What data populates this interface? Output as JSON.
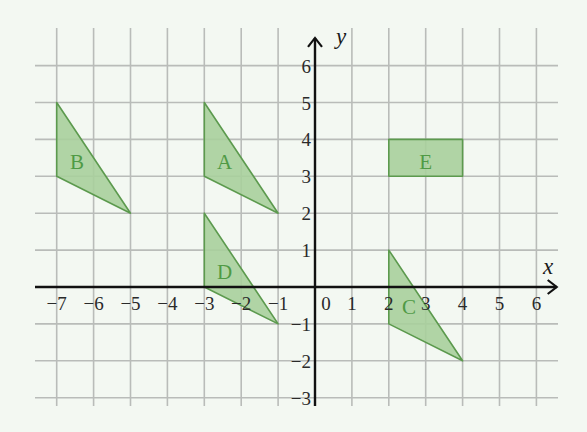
{
  "axes": {
    "x_label": "x",
    "y_label": "y",
    "x_min": -7,
    "x_max": 6,
    "y_min": -3,
    "y_max": 6,
    "x_ticks": [
      "−7",
      "−6",
      "−5",
      "−4",
      "−3",
      "−2",
      "−1",
      "0",
      "1",
      "2",
      "3",
      "4",
      "5",
      "6"
    ],
    "y_ticks": [
      "6",
      "5",
      "4",
      "3",
      "2",
      "1",
      "−1",
      "−2",
      "−3"
    ]
  },
  "colors": {
    "background": "#f3f8f2",
    "grid": "#b9bcb9",
    "axis": "#111111",
    "shape_fill": "#a9cf9c",
    "shape_stroke": "#5c9a4e",
    "label": "#4f9a45"
  },
  "shapes": [
    {
      "label": "A",
      "type": "triangle",
      "vertices": [
        [
          -3,
          5
        ],
        [
          -3,
          3
        ],
        [
          -1,
          2
        ]
      ],
      "label_pos": [
        -2.45,
        3.4
      ]
    },
    {
      "label": "B",
      "type": "triangle",
      "vertices": [
        [
          -7,
          5
        ],
        [
          -7,
          3
        ],
        [
          -5,
          2
        ]
      ],
      "label_pos": [
        -6.45,
        3.4
      ]
    },
    {
      "label": "C",
      "type": "triangle",
      "vertices": [
        [
          2,
          1
        ],
        [
          2,
          -1
        ],
        [
          4,
          -2
        ]
      ],
      "label_pos": [
        2.55,
        -0.55
      ]
    },
    {
      "label": "D",
      "type": "triangle",
      "vertices": [
        [
          -3,
          2
        ],
        [
          -3,
          0
        ],
        [
          -1,
          -1
        ]
      ],
      "label_pos": [
        -2.45,
        0.4
      ]
    },
    {
      "label": "E",
      "type": "rectangle",
      "vertices": [
        [
          2,
          4
        ],
        [
          4,
          4
        ],
        [
          4,
          3
        ],
        [
          2,
          3
        ]
      ],
      "label_pos": [
        3,
        3.4
      ]
    }
  ]
}
